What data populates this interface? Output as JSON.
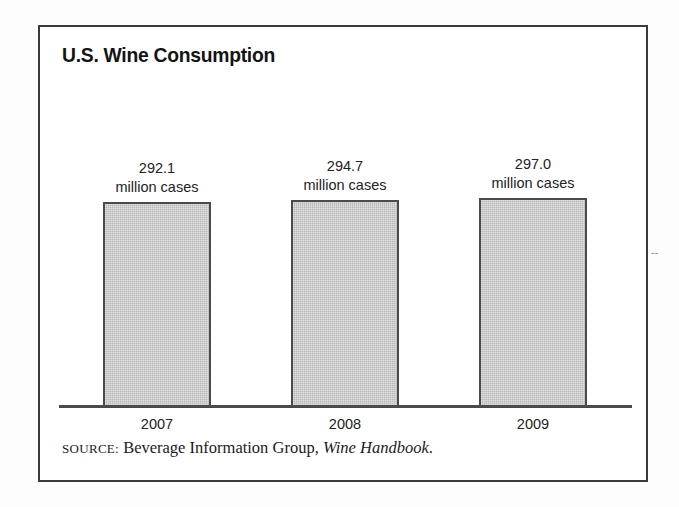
{
  "figure": {
    "title": "U.S. Wine Consumption",
    "source": {
      "label": "SOURCE:",
      "publisher": "Beverage Information Group,",
      "title": "Wine Handbook",
      "terminator": "."
    },
    "colors": {
      "bar_fill": "#b9b9b9",
      "bar_outline": "#4a4a4a",
      "frame": "#3a3a3a",
      "text": "#232323",
      "title": "#141414"
    }
  },
  "chart_data": {
    "type": "bar",
    "title": "U.S. Wine Consumption",
    "xlabel": "",
    "ylabel": "million cases",
    "categories": [
      "2007",
      "2008",
      "2009"
    ],
    "values": [
      292.1,
      294.7,
      297.0
    ],
    "value_labels": [
      "292.1",
      "294.7",
      "297.0"
    ],
    "unit_labels": [
      "million cases",
      "million cases",
      "million cases"
    ],
    "unit": "million cases",
    "ylim": [
      280.0,
      298.5
    ],
    "grid": false,
    "legend": null,
    "axis_visible": {
      "x": true,
      "y": false
    },
    "bar_heights_px": [
      205,
      207,
      209
    ]
  }
}
